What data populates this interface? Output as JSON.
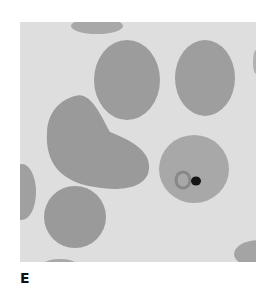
{
  "figure": {
    "panel_label": "E",
    "colors": {
      "background": "#dedede",
      "cell": "#9c9c9c",
      "parasite_dot": "#151515"
    }
  }
}
